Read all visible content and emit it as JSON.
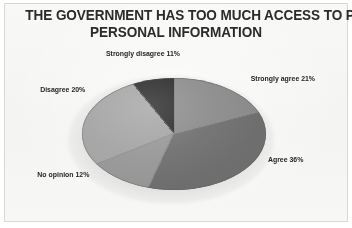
{
  "card": {
    "background_color": "#f7f7f5",
    "border_color": "#d8d8d6"
  },
  "title": {
    "line1": "THE GOVERNMENT HAS TOO MUCH ACCESS TO PEOPLE'S",
    "line2": "PERSONAL INFORMATION"
  },
  "labels": {
    "strongly_disagree": "Strongly disagree 11%",
    "strongly_agree": "Strongly agree 21%",
    "agree": "Agree 36%",
    "no_opinion": "No opinion 12%",
    "disagree": "Disagree 20%"
  },
  "chart_data": {
    "type": "pie",
    "title": "THE GOVERNMENT HAS TOO MUCH ACCESS TO PEOPLE'S PERSONAL INFORMATION",
    "subtitle": "",
    "xlabel": "",
    "ylabel": "",
    "units": "percent",
    "total": 100,
    "three_d": true,
    "legend": "none-labels-around-slices",
    "grid": false,
    "start_angle_deg": 0,
    "direction": "clockwise",
    "categories": [
      "Strongly agree",
      "Agree",
      "No opinion",
      "Disagree",
      "Strongly disagree"
    ],
    "values": [
      21,
      36,
      12,
      20,
      11
    ],
    "labels": [
      "Strongly agree 21%",
      "Agree 36%",
      "No opinion 12%",
      "Disagree 20%",
      "Strongly disagree 11%"
    ],
    "colors": [
      "#8a8a8a",
      "#6e6e6e",
      "#969696",
      "#a3a3a3",
      "#272727"
    ],
    "slices": [
      {
        "name": "Strongly agree",
        "value": 21,
        "label": "Strongly agree 21%",
        "color": "#8a8a8a",
        "start_deg": 0,
        "end_deg": 75.6
      },
      {
        "name": "Agree",
        "value": 36,
        "label": "Agree 36%",
        "color": "#6e6e6e",
        "start_deg": 75.6,
        "end_deg": 205.2
      },
      {
        "name": "No opinion",
        "value": 12,
        "label": "No opinion 12%",
        "color": "#969696",
        "start_deg": 205.2,
        "end_deg": 248.4
      },
      {
        "name": "Disagree",
        "value": 20,
        "label": "Disagree 20%",
        "color": "#a3a3a3",
        "start_deg": 248.4,
        "end_deg": 320.4
      },
      {
        "name": "Strongly disagree",
        "value": 11,
        "label": "Strongly disagree 11%",
        "color": "#272727",
        "start_deg": 320.4,
        "end_deg": 360
      }
    ]
  }
}
